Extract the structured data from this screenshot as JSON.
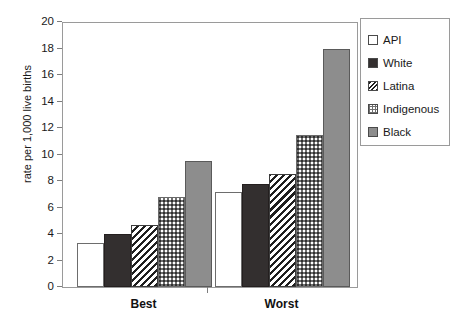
{
  "chart_data": {
    "type": "bar",
    "title": "",
    "xlabel": "",
    "ylabel": "rate per 1,000 live births",
    "categories": [
      "Best",
      "Worst"
    ],
    "ylim": [
      0,
      20
    ],
    "yticks": [
      0,
      2,
      4,
      6,
      8,
      10,
      12,
      14,
      16,
      18,
      20
    ],
    "grid": false,
    "legend_position": "right",
    "series": [
      {
        "name": "API",
        "values": [
          3.3,
          7.2
        ],
        "fill": "empty-white",
        "color": "#ffffff"
      },
      {
        "name": "White",
        "values": [
          4.0,
          7.8
        ],
        "fill": "solid-dark",
        "color": "#332f2f"
      },
      {
        "name": "Latina",
        "values": [
          4.7,
          8.5
        ],
        "fill": "diagonal-hatch",
        "color": "#1f1f1f"
      },
      {
        "name": "Indigenous",
        "values": [
          6.8,
          11.5
        ],
        "fill": "cross-hatch",
        "color": "#6f6f6f"
      },
      {
        "name": "Black",
        "values": [
          9.5,
          18.0
        ],
        "fill": "solid-gray",
        "color": "#8d8d8d"
      }
    ]
  },
  "axis": {
    "y_label": "rate per 1,000 live births",
    "y_tick_labels": [
      "20",
      "18",
      "16",
      "14",
      "12",
      "10",
      "8",
      "6",
      "4",
      "2",
      "0"
    ],
    "x_tick_labels": [
      "Best",
      "Worst"
    ]
  },
  "legend": {
    "items": [
      {
        "label": "API"
      },
      {
        "label": "White"
      },
      {
        "label": "Latina"
      },
      {
        "label": "Indigenous"
      },
      {
        "label": "Black"
      }
    ]
  },
  "colors": {
    "axis_line": "#9a9a9a",
    "tick": "#7d7d7d",
    "text": "#1a1a1a",
    "background": "#ffffff"
  }
}
